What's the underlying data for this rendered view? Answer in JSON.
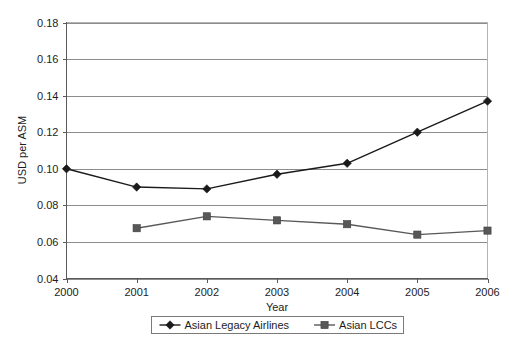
{
  "chart_data": {
    "type": "line",
    "title": "",
    "xlabel": "Year",
    "ylabel": "USD per ASM",
    "categories": [
      "2000",
      "2001",
      "2002",
      "2003",
      "2004",
      "2005",
      "2006"
    ],
    "x": [
      2000,
      2001,
      2002,
      2003,
      2004,
      2005,
      2006
    ],
    "xlim": [
      2000,
      2006
    ],
    "ylim": [
      0.04,
      0.18
    ],
    "yticks": [
      0.04,
      0.06,
      0.08,
      0.1,
      0.12,
      0.14,
      0.16,
      0.18
    ],
    "ytick_labels": [
      "0.04",
      "0.06",
      "0.08",
      "0.10",
      "0.12",
      "0.14",
      "0.16",
      "0.18"
    ],
    "grid": "horizontal",
    "legend_position": "bottom-center",
    "series": [
      {
        "name": "Asian Legacy Airlines",
        "marker": "diamond",
        "color": "#1a1a1a",
        "values": [
          0.1,
          0.09,
          0.089,
          0.097,
          0.103,
          0.12,
          0.137
        ]
      },
      {
        "name": "Asian LCCs",
        "marker": "square",
        "color": "#585858",
        "values": [
          null,
          0.0675,
          0.074,
          0.0718,
          0.0697,
          0.064,
          0.0662
        ]
      }
    ]
  },
  "legend": {
    "entries": [
      {
        "label": "Asian Legacy Airlines",
        "marker": "diamond-marker-icon"
      },
      {
        "label": "Asian LCCs",
        "marker": "square-marker-icon"
      }
    ]
  },
  "axes": {
    "y_title": "USD per ASM",
    "x_title": "Year"
  }
}
